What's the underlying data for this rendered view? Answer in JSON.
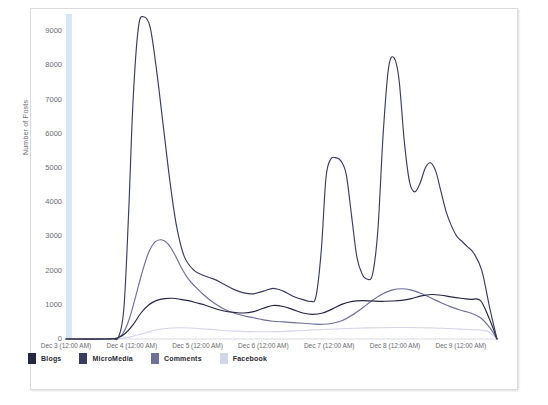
{
  "chart_data": {
    "type": "line",
    "title": "",
    "xlabel": "",
    "ylabel": "Number of Posts",
    "ylim": [
      0,
      9500
    ],
    "yticks": [
      0,
      1000,
      2000,
      3000,
      4000,
      5000,
      6000,
      7000,
      8000,
      9000
    ],
    "ytick_labels": [
      "0",
      "1000",
      "2000",
      "3000",
      "4000",
      "5000",
      "6000",
      "7000",
      "8000",
      "9000"
    ],
    "grid": false,
    "legend_position": "bottom-left",
    "x_tick_labels": [
      "Dec 3 (12:00 AM)",
      "Dec 4 (12:00 AM)",
      "Dec 5 (12:00 AM)",
      "Dec 6 (12:00 AM)",
      "Dec 7 (12:00 AM)",
      "Dec 8 (12:00 AM)",
      "Dec 9 (12:00 AM)"
    ],
    "x_tick_values": [
      0,
      1,
      2,
      3,
      4,
      5,
      6
    ],
    "xlim": [
      0,
      6.55
    ],
    "colors": {
      "Blogs": "#262842",
      "MicroMedia": "#3b3c5e",
      "Comments": "#6f7096",
      "Facebook": "#d3d5e8",
      "highlight_band": "#cfe0ef"
    },
    "series": [
      {
        "name": "MicroMedia",
        "color": "#3b3c5e",
        "x": [
          0.0,
          0.55,
          0.7,
          0.8,
          0.88,
          0.95,
          1.02,
          1.1,
          1.18,
          1.28,
          1.38,
          1.48,
          1.58,
          1.68,
          1.8,
          1.95,
          2.1,
          2.25,
          2.4,
          2.55,
          2.7,
          2.85,
          3.0,
          3.15,
          3.3,
          3.45,
          3.6,
          3.72,
          3.8,
          3.88,
          3.95,
          4.02,
          4.1,
          4.18,
          4.26,
          4.34,
          4.42,
          4.5,
          4.58,
          4.66,
          4.74,
          4.82,
          4.9,
          4.98,
          5.06,
          5.14,
          5.22,
          5.3,
          5.38,
          5.46,
          5.54,
          5.62,
          5.7,
          5.78,
          5.86,
          5.94,
          6.02,
          6.1,
          6.2,
          6.32,
          6.44,
          6.55
        ],
        "y": [
          0,
          0,
          10,
          60,
          900,
          3600,
          7000,
          9100,
          9420,
          9100,
          7800,
          6200,
          4600,
          3300,
          2400,
          2000,
          1850,
          1750,
          1600,
          1450,
          1350,
          1320,
          1400,
          1480,
          1400,
          1250,
          1150,
          1100,
          1250,
          2600,
          4700,
          5250,
          5300,
          5200,
          4800,
          3600,
          2400,
          1900,
          1750,
          1900,
          3200,
          6000,
          7900,
          8230,
          7600,
          5800,
          4600,
          4300,
          4550,
          5000,
          5150,
          4900,
          4300,
          3700,
          3300,
          3000,
          2850,
          2700,
          2500,
          2000,
          900,
          0
        ]
      },
      {
        "name": "Comments",
        "color": "#6f7096",
        "x": [
          0.0,
          0.6,
          0.75,
          0.85,
          0.95,
          1.05,
          1.15,
          1.25,
          1.35,
          1.45,
          1.55,
          1.65,
          1.75,
          1.85,
          1.95,
          2.1,
          2.25,
          2.4,
          2.55,
          2.7,
          2.85,
          3.0,
          3.15,
          3.3,
          3.45,
          3.6,
          3.75,
          3.9,
          4.05,
          4.2,
          4.35,
          4.5,
          4.65,
          4.8,
          4.95,
          5.1,
          5.25,
          5.4,
          5.55,
          5.7,
          5.85,
          6.0,
          6.15,
          6.3,
          6.44,
          6.55
        ],
        "y": [
          0,
          0,
          20,
          120,
          520,
          1180,
          1900,
          2500,
          2830,
          2900,
          2780,
          2480,
          2100,
          1780,
          1560,
          1280,
          1050,
          880,
          760,
          680,
          620,
          560,
          520,
          500,
          480,
          460,
          440,
          430,
          460,
          540,
          700,
          900,
          1120,
          1310,
          1430,
          1470,
          1430,
          1330,
          1200,
          1060,
          940,
          840,
          760,
          620,
          330,
          0
        ]
      },
      {
        "name": "Blogs",
        "color": "#262842",
        "x": [
          0.0,
          0.6,
          0.78,
          0.9,
          1.02,
          1.14,
          1.26,
          1.38,
          1.5,
          1.62,
          1.74,
          1.86,
          1.98,
          2.1,
          2.25,
          2.4,
          2.55,
          2.7,
          2.85,
          3.0,
          3.15,
          3.3,
          3.45,
          3.6,
          3.75,
          3.9,
          4.05,
          4.2,
          4.35,
          4.5,
          4.65,
          4.8,
          4.95,
          5.1,
          5.25,
          5.4,
          5.55,
          5.7,
          5.85,
          6.0,
          6.15,
          6.3,
          6.44,
          6.55
        ],
        "y": [
          0,
          0,
          30,
          160,
          420,
          760,
          1000,
          1130,
          1180,
          1190,
          1160,
          1120,
          1060,
          1000,
          900,
          820,
          780,
          760,
          800,
          900,
          980,
          950,
          860,
          760,
          720,
          760,
          880,
          1020,
          1100,
          1120,
          1110,
          1100,
          1110,
          1130,
          1180,
          1260,
          1300,
          1280,
          1230,
          1190,
          1160,
          1120,
          560,
          0
        ]
      },
      {
        "name": "Facebook",
        "color": "#d3d5e8",
        "x": [
          0.0,
          0.65,
          0.85,
          1.0,
          1.15,
          1.3,
          1.45,
          1.6,
          1.75,
          1.9,
          2.05,
          2.2,
          2.4,
          2.6,
          2.8,
          3.0,
          3.2,
          3.4,
          3.6,
          3.8,
          4.0,
          4.2,
          4.4,
          4.6,
          4.8,
          5.0,
          5.2,
          5.4,
          5.6,
          5.8,
          6.0,
          6.2,
          6.4,
          6.55
        ],
        "y": [
          0,
          0,
          15,
          70,
          150,
          230,
          290,
          320,
          330,
          320,
          300,
          280,
          250,
          230,
          215,
          210,
          215,
          230,
          250,
          270,
          285,
          300,
          315,
          325,
          330,
          335,
          335,
          330,
          320,
          305,
          290,
          270,
          230,
          0
        ]
      }
    ],
    "highlight_band": {
      "x_start": 0.0,
      "x_end": 0.09,
      "color": "#cfe0ef"
    }
  },
  "legend": {
    "items": [
      {
        "label": "Blogs",
        "color": "#262842"
      },
      {
        "label": "MicroMedia",
        "color": "#3b3c5e"
      },
      {
        "label": "Comments",
        "color": "#6f7096"
      },
      {
        "label": "Facebook",
        "color": "#d3d5e8"
      }
    ]
  }
}
